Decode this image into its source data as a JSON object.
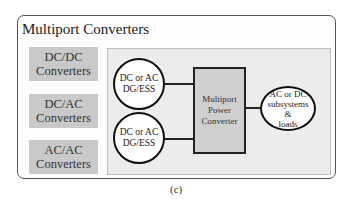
{
  "figure": {
    "title": "Multiport Converters",
    "caption": "(c)",
    "converter_types": [
      {
        "line1": "DC/DC",
        "line2": "Converters"
      },
      {
        "line1": "DC/AC",
        "line2": "Converters"
      },
      {
        "line1": "AC/AC",
        "line2": "Converters"
      }
    ],
    "sources": [
      {
        "line1": "DC or AC",
        "line2": "DG/ESS"
      },
      {
        "line1": "DC or AC",
        "line2": "DG/ESS"
      }
    ],
    "converter": {
      "line1": "Multiport",
      "line2": "Power",
      "line3": "Converter"
    },
    "load": {
      "line1": "AC or DC",
      "line2": "subsystems",
      "line3": "&",
      "line4": "loads"
    }
  }
}
